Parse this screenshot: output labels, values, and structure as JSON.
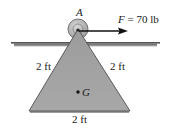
{
  "diagram": {
    "pin_label": "A",
    "force_label": "F = 70 lb",
    "force_symbol": "F",
    "force_value": "70 lb",
    "left_side_label": "2 ft",
    "right_side_label": "2 ft",
    "base_label": "2 ft",
    "center_of_gravity_label": "G",
    "colors": {
      "triangle_fill": "#a3a3a3",
      "triangle_edge": "#555555",
      "pin_circle": "#b8b8b8",
      "support_bar": "#6e6e6e",
      "arrow": "#111111"
    }
  }
}
